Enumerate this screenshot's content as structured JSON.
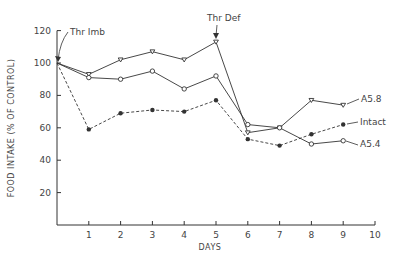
{
  "chart_data": {
    "type": "line",
    "title": "",
    "xlabel": "DAYS",
    "ylabel": "FOOD INTAKE (% OF CONTROL)",
    "x": [
      0,
      1,
      2,
      3,
      4,
      5,
      6,
      7,
      8,
      9
    ],
    "xticks": [
      1,
      2,
      3,
      4,
      5,
      6,
      7,
      8,
      9,
      10
    ],
    "yticks": [
      20,
      40,
      60,
      80,
      100,
      120
    ],
    "xlim": [
      0,
      10
    ],
    "ylim": [
      0,
      120
    ],
    "grid": false,
    "legend_position": "inline-right",
    "series": [
      {
        "name": "A5.8",
        "marker": "open-triangle",
        "line": "solid",
        "values": [
          100,
          93,
          102,
          107,
          102,
          113,
          57,
          60,
          77,
          74
        ]
      },
      {
        "name": "A5.4",
        "marker": "open-circle",
        "line": "solid",
        "values": [
          100,
          91,
          90,
          95,
          84,
          92,
          62,
          60,
          50,
          52
        ]
      },
      {
        "name": "Intact",
        "marker": "filled-circle",
        "line": "dashed",
        "values": [
          100,
          59,
          69,
          71,
          70,
          77,
          53,
          49,
          56,
          62
        ]
      }
    ],
    "annotations": [
      {
        "text": "Thr Imb",
        "x": 0,
        "y": 100
      },
      {
        "text": "Thr Def",
        "x": 5,
        "y": 113
      }
    ]
  },
  "labels": {
    "x_axis_title": "DAYS",
    "y_axis_title": "FOOD INTAKE (% OF CONTROL)",
    "annot_imb": "Thr Imb",
    "annot_def": "Thr Def",
    "legend_a58": "A5.8",
    "legend_intact": "Intact",
    "legend_a54": "A5.4"
  },
  "colors": {
    "ink": "#333333"
  }
}
